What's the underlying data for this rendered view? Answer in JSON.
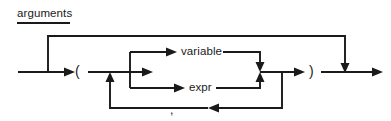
{
  "diagram": {
    "title": "arguments",
    "type": "railroad-syntax-diagram",
    "colors": {
      "rail": "#1a1a1a",
      "text": "#1a1a1a",
      "background": "#ffffff"
    },
    "terminals": {
      "left_paren": "(",
      "right_paren": ")",
      "comma": ","
    },
    "nonterminals": {
      "variable": "variable",
      "expr": "expr"
    },
    "paths": [
      {
        "name": "bypass",
        "description": "top line skips the entire argument list"
      },
      {
        "name": "variable-branch",
        "description": "upper alternative inside the parentheses"
      },
      {
        "name": "expr-branch",
        "description": "lower alternative inside the parentheses"
      },
      {
        "name": "comma-repeat",
        "description": "bottom loop back through a comma separator"
      }
    ]
  }
}
